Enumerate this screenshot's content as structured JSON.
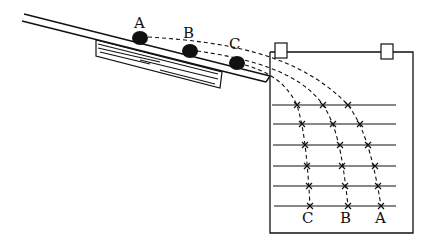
{
  "diagram": {
    "balls": [
      {
        "label": "A"
      },
      {
        "label": "B"
      },
      {
        "label": "C"
      }
    ],
    "board_labels": [
      {
        "label": "C"
      },
      {
        "label": "B"
      },
      {
        "label": "A"
      }
    ],
    "horizontal_lines": 6,
    "clips": 2,
    "colors": {
      "ink": "#111111",
      "background": "#ffffff"
    }
  }
}
